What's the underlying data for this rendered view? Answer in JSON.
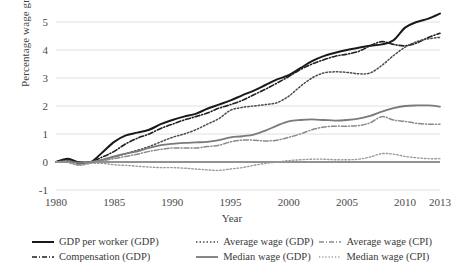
{
  "chart_data": {
    "type": "line",
    "title": "",
    "xlabel": "Year",
    "ylabel": "Percentage wage growth (%)",
    "xlim": [
      1980,
      2013
    ],
    "ylim": [
      -1,
      5
    ],
    "xticks": [
      "1980",
      "1985",
      "1990",
      "1995",
      "2000",
      "2005",
      "2010",
      "2013"
    ],
    "yticks": [
      "-1",
      "0",
      "1",
      "2",
      "3",
      "4",
      "5"
    ],
    "grid": "horizontal",
    "legend_position": "bottom",
    "x": [
      1980,
      1981,
      1982,
      1983,
      1984,
      1985,
      1986,
      1987,
      1988,
      1989,
      1990,
      1991,
      1992,
      1993,
      1994,
      1995,
      1996,
      1997,
      1998,
      1999,
      2000,
      2001,
      2002,
      2003,
      2004,
      2005,
      2006,
      2007,
      2008,
      2009,
      2010,
      2011,
      2012,
      2013
    ],
    "series": [
      {
        "name": "GDP per worker (GDP)",
        "style": "solid",
        "color": "#1a1a1a",
        "width": 2.0,
        "values": [
          0.0,
          0.12,
          -0.02,
          0.0,
          0.35,
          0.72,
          0.95,
          1.05,
          1.15,
          1.35,
          1.5,
          1.62,
          1.72,
          1.9,
          2.05,
          2.2,
          2.38,
          2.55,
          2.75,
          2.95,
          3.1,
          3.35,
          3.6,
          3.78,
          3.9,
          4.0,
          4.08,
          4.15,
          4.2,
          4.35,
          4.8,
          5.0,
          5.12,
          5.3
        ]
      },
      {
        "name": "Compensation (GDP)",
        "style": "dashdot",
        "color": "#1f1f1f",
        "width": 1.6,
        "values": [
          0.0,
          0.1,
          -0.04,
          0.0,
          0.18,
          0.38,
          0.65,
          0.85,
          1.0,
          1.2,
          1.35,
          1.5,
          1.62,
          1.75,
          1.92,
          2.05,
          2.2,
          2.4,
          2.6,
          2.82,
          3.05,
          3.3,
          3.5,
          3.65,
          3.78,
          3.85,
          3.95,
          4.15,
          4.3,
          4.2,
          4.15,
          4.25,
          4.45,
          4.6
        ]
      },
      {
        "name": "Average wage (GDP)",
        "style": "dotted",
        "color": "#4a4a4a",
        "width": 1.5,
        "values": [
          0.0,
          0.05,
          -0.05,
          0.0,
          0.08,
          0.18,
          0.3,
          0.42,
          0.55,
          0.72,
          0.88,
          1.0,
          1.15,
          1.35,
          1.55,
          1.85,
          1.95,
          2.0,
          2.05,
          2.12,
          2.35,
          2.7,
          3.0,
          3.18,
          3.22,
          3.2,
          3.15,
          3.18,
          3.45,
          3.8,
          4.1,
          4.3,
          4.4,
          4.45
        ]
      },
      {
        "name": "Median wage (GDP)",
        "style": "solid",
        "color": "#7a7a7a",
        "width": 1.8,
        "values": [
          0.0,
          0.02,
          -0.03,
          0.0,
          0.08,
          0.2,
          0.3,
          0.38,
          0.5,
          0.6,
          0.65,
          0.68,
          0.7,
          0.72,
          0.78,
          0.88,
          0.92,
          0.98,
          1.12,
          1.3,
          1.45,
          1.5,
          1.52,
          1.5,
          1.48,
          1.5,
          1.55,
          1.65,
          1.8,
          1.92,
          2.0,
          2.02,
          2.02,
          1.98
        ]
      },
      {
        "name": "Average wage (CPI)",
        "style": "dashdot",
        "color": "#8a8a8a",
        "width": 1.5,
        "values": [
          0.0,
          0.0,
          -0.1,
          0.0,
          0.05,
          0.12,
          0.2,
          0.28,
          0.38,
          0.45,
          0.5,
          0.5,
          0.5,
          0.55,
          0.6,
          0.72,
          0.78,
          0.78,
          0.75,
          0.78,
          0.88,
          1.0,
          1.15,
          1.25,
          1.28,
          1.28,
          1.3,
          1.4,
          1.62,
          1.5,
          1.45,
          1.38,
          1.35,
          1.35
        ]
      },
      {
        "name": "Median wage (CPI)",
        "style": "dotted",
        "color": "#9a9a9a",
        "width": 1.4,
        "values": [
          0.0,
          -0.02,
          -0.12,
          -0.05,
          -0.05,
          -0.1,
          -0.12,
          -0.15,
          -0.18,
          -0.2,
          -0.2,
          -0.22,
          -0.25,
          -0.28,
          -0.3,
          -0.25,
          -0.2,
          -0.12,
          -0.05,
          0.0,
          0.05,
          0.08,
          0.1,
          0.1,
          0.08,
          0.08,
          0.1,
          0.18,
          0.3,
          0.28,
          0.2,
          0.15,
          0.12,
          0.12
        ]
      }
    ]
  },
  "legend": {
    "entries": [
      {
        "label": "GDP per worker (GDP)"
      },
      {
        "label": "Average wage (GDP)"
      },
      {
        "label": "Average wage (CPI)"
      },
      {
        "label": "Compensation (GDP)"
      },
      {
        "label": "Median wage (GDP)"
      },
      {
        "label": "Median wage (CPI)"
      }
    ]
  }
}
